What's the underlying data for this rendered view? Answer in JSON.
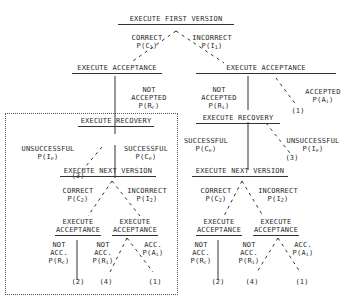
{
  "diagram": {
    "root": {
      "label": "EXECUTE FIRST VERSION"
    },
    "first_branches": {
      "correct": {
        "line1": "CORRECT",
        "prob": "P(C",
        "sub": "1",
        "close": ")"
      },
      "incorrect": {
        "line1": "INCORRECT",
        "prob": "P(I",
        "sub": "1",
        "close": ")"
      }
    },
    "left_acceptance": {
      "label": "EXECUTE ACCEPTANCE",
      "not_accepted": {
        "line1": "NOT",
        "line2": "ACCEPTED",
        "prob": "P(R",
        "sub": "c",
        "close": ")"
      }
    },
    "right_acceptance": {
      "label": "EXECUTE ACCEPTANCE",
      "not_accepted": {
        "line1": "NOT",
        "line2": "ACCEPTED",
        "prob": "P(R",
        "sub": "i",
        "close": ")"
      },
      "accepted": {
        "line1": "ACCEPTED",
        "prob": "P(A",
        "sub": "i",
        "close": ")",
        "outcome": "(1)"
      }
    },
    "left_recovery": {
      "label": "EXECUTE RECOVERY",
      "unsuccessful": {
        "line1": "UNSUCCESSFUL",
        "prob": "P(I",
        "sub": "e",
        "close": ")",
        "outcome": "(3)"
      },
      "successful": {
        "line1": "SUCCESSFUL",
        "prob": "P(C",
        "sub": "e",
        "close": ")"
      }
    },
    "right_recovery": {
      "label": "EXECUTE RECOVERY",
      "successful": {
        "line1": "SUCCESSFUL",
        "prob": "P(C",
        "sub": "e",
        "close": ")"
      },
      "unsuccessful": {
        "line1": "UNSUCCESSFUL",
        "prob": "P(I",
        "sub": "e",
        "close": ")",
        "outcome": "(3)"
      }
    },
    "left_next_version": {
      "label": "EXECUTE NEXT VERSION",
      "correct": {
        "line1": "CORRECT",
        "prob": "P(C",
        "sub": "2",
        "close": ")"
      },
      "incorrect": {
        "line1": "INCORRECT",
        "prob": "P(I",
        "sub": "2",
        "close": ")"
      },
      "acceptance_left": {
        "line1": "EXECUTE",
        "line2": "ACCEPTANCE",
        "not_acc": {
          "line1": "NOT",
          "line2": "ACC.",
          "prob": "P(R",
          "sub": "c",
          "close": ")",
          "outcome": "(2)"
        }
      },
      "acceptance_right": {
        "line1": "EXECUTE",
        "line2": "ACCEPTANCE",
        "not_acc": {
          "line1": "NOT",
          "line2": "ACC.",
          "prob": "P(R",
          "sub": "i",
          "close": ")",
          "outcome": "(4)"
        },
        "acc": {
          "line1": "ACC.",
          "prob": "P(A",
          "sub": "i",
          "close": ")",
          "outcome": "(1)"
        }
      }
    },
    "right_next_version": {
      "label": "EXECUTE NEXT VERSION",
      "correct": {
        "line1": "CORRECT",
        "prob": "P(C",
        "sub": "2",
        "close": ")"
      },
      "incorrect": {
        "line1": "INCORRECT",
        "prob": "P(I",
        "sub": "2",
        "close": ")"
      },
      "acceptance_left": {
        "line1": "EXECUTE",
        "line2": "ACCEPTANCE",
        "not_acc": {
          "line1": "NOT",
          "line2": "ACC.",
          "prob": "P(R",
          "sub": "c",
          "close": ")",
          "outcome": "(2)"
        }
      },
      "acceptance_right": {
        "line1": "EXECUTE",
        "line2": "ACCEPTANCE",
        "not_acc": {
          "line1": "NOT",
          "line2": "ACC.",
          "prob": "P(R",
          "sub": "i",
          "close": ")",
          "outcome": "(4)"
        },
        "acc": {
          "line1": "ACC.",
          "prob": "P(A",
          "sub": "i",
          "close": ")",
          "outcome": "(1)"
        }
      }
    }
  }
}
